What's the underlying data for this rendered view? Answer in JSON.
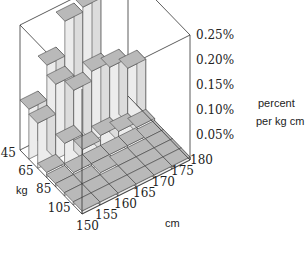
{
  "chart_data": {
    "type": "bar3d",
    "title": "",
    "xlabel": "cm",
    "ylabel": "kg",
    "zlabel": "percent per kg cm",
    "x_ticks": [
      "150",
      "155",
      "160",
      "165",
      "170",
      "175",
      "180"
    ],
    "y_ticks": [
      "45",
      "65",
      "85",
      "105"
    ],
    "z_ticks": [
      "0.05%",
      "0.10%",
      "0.15%",
      "0.20%",
      "0.25%"
    ],
    "zlim": [
      0,
      0.25
    ],
    "x_bins": [
      "150-155",
      "155-160",
      "160-165",
      "165-170",
      "170-175",
      "175-180"
    ],
    "y_bins": [
      "45-55",
      "55-65",
      "65-75",
      "75-85",
      "85-95",
      "95-105",
      "105-115"
    ],
    "values_percent": [
      [
        0.1,
        0.17,
        0.24,
        0.25,
        0.01,
        0.0
      ],
      [
        0.09,
        0.15,
        0.12,
        0.14,
        0.13,
        0.11
      ],
      [
        0.01,
        0.05,
        0.02,
        0.03,
        0.02,
        0.01
      ],
      [
        0.0,
        0.01,
        0.01,
        0.01,
        0.01,
        0.0
      ],
      [
        0.0,
        0.0,
        0.01,
        0.0,
        0.0,
        0.0
      ],
      [
        0.0,
        0.0,
        0.0,
        0.0,
        0.0,
        0.0
      ],
      [
        0.0,
        0.0,
        0.0,
        0.0,
        0.0,
        0.0
      ]
    ],
    "grid": false,
    "legend": null
  },
  "labels": {
    "z_title_line1": "percent",
    "z_title_line2": "per kg cm",
    "x_axis": "cm",
    "y_axis": "kg"
  }
}
